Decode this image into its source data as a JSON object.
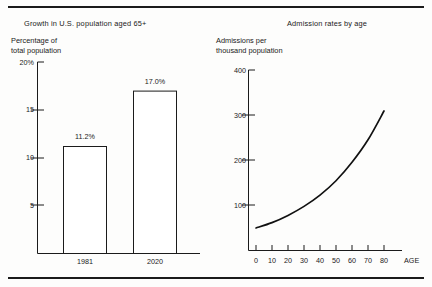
{
  "figure": {
    "name": "two-panel-statistical-figure",
    "border_color": "#1b1b1b",
    "background_color": "#fdfdfc"
  },
  "panels": [
    {
      "id": "left",
      "title": "Growth in U.S. population aged 65+",
      "y_axis_caption_line1": "Percentage of",
      "y_axis_caption_line2": "total population"
    },
    {
      "id": "right",
      "title": "Admission rates by age",
      "y_axis_caption_line1": "Admissions per",
      "y_axis_caption_line2": "thousand population",
      "x_axis_name": "AGE"
    }
  ],
  "chart_data": [
    {
      "type": "bar",
      "title": "Growth in U.S. population aged 65+",
      "xlabel": "",
      "ylabel": "Percentage of total population",
      "categories": [
        "1981",
        "2020"
      ],
      "values": [
        11.2,
        17.0
      ],
      "data_labels": [
        "11.2%",
        "17.0%"
      ],
      "ylim": [
        0,
        20
      ],
      "yticks": [
        5,
        10,
        15,
        20
      ],
      "ytick_labels": [
        "5",
        "10",
        "15",
        "20%"
      ],
      "grid": false,
      "legend": "none"
    },
    {
      "type": "line",
      "title": "Admission rates by age",
      "xlabel": "AGE",
      "ylabel": "Admissions per thousand population",
      "x": [
        0,
        10,
        20,
        30,
        40,
        50,
        60,
        70,
        80
      ],
      "values": [
        50,
        62,
        78,
        98,
        123,
        155,
        196,
        246,
        310
      ],
      "ylim": [
        0,
        400
      ],
      "yticks": [
        100,
        200,
        300,
        400
      ],
      "ytick_labels": [
        "100",
        "200",
        "300",
        "400"
      ],
      "xlim": [
        0,
        80
      ],
      "xticks": [
        0,
        10,
        20,
        30,
        40,
        50,
        60,
        70,
        80
      ],
      "xtick_labels": [
        "0",
        "10",
        "20",
        "30",
        "40",
        "50",
        "60",
        "70",
        "80"
      ],
      "grid": false,
      "legend": "none"
    }
  ]
}
